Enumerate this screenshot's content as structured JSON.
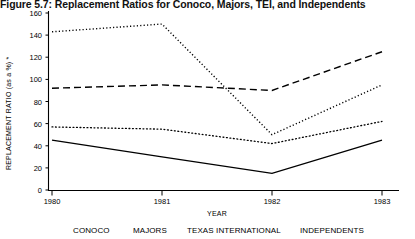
{
  "figure": {
    "title": "Figure 5.7:  Replacement Ratios for Conoco, Majors, TEI, and Independents"
  },
  "axes": {
    "ylabel": "REPLACEMENT RATIO (as a %) *",
    "xlabel": "YEAR",
    "yticks": [
      "0",
      "20",
      "40",
      "60",
      "80",
      "100",
      "120",
      "140",
      "160"
    ],
    "xticks": [
      "1980",
      "1981",
      "1982",
      "1983"
    ]
  },
  "legend": {
    "items": [
      {
        "label": "CONOCO",
        "style": "solid"
      },
      {
        "label": "MAJORS",
        "style": "dashed"
      },
      {
        "label": "TEXAS INTERNATIONAL",
        "style": "dash-dot"
      },
      {
        "label": "INDEPENDENTS",
        "style": "dotted"
      }
    ]
  },
  "chart_data": {
    "type": "line",
    "title": "Figure 5.7:  Replacement Ratios for Conoco, Majors, TEI, and Independents",
    "xlabel": "YEAR",
    "ylabel": "REPLACEMENT RATIO (as a %) *",
    "x": [
      "1980",
      "1981",
      "1982",
      "1983"
    ],
    "ylim": [
      0,
      160
    ],
    "yticks": [
      0,
      20,
      40,
      60,
      80,
      100,
      120,
      140,
      160
    ],
    "grid": false,
    "legend_position": "bottom",
    "series": [
      {
        "name": "CONOCO",
        "style": "solid",
        "values": [
          45,
          30,
          15,
          45
        ]
      },
      {
        "name": "MAJORS",
        "style": "dashed",
        "values": [
          92,
          95,
          90,
          125
        ]
      },
      {
        "name": "TEXAS INTERNATIONAL",
        "style": "dash-dot",
        "values": [
          143,
          150,
          50,
          95
        ]
      },
      {
        "name": "INDEPENDENTS",
        "style": "dotted",
        "values": [
          57,
          55,
          42,
          62
        ]
      }
    ]
  }
}
